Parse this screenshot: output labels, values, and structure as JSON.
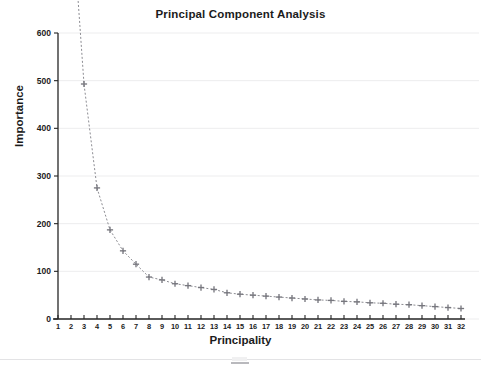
{
  "chart_data": {
    "type": "line",
    "title": "Principal Component Analysis",
    "xlabel": "Principality",
    "ylabel": "Importance",
    "xlim": [
      0.4,
      32.6
    ],
    "ylim": [
      0,
      600
    ],
    "grid": true,
    "legend_position": "none",
    "marker": "plus",
    "linestyle": "dotted",
    "series_color": "#8c8c92",
    "x": [
      1,
      2,
      3,
      4,
      5,
      6,
      7,
      8,
      9,
      10,
      11,
      12,
      13,
      14,
      15,
      16,
      17,
      18,
      19,
      20,
      21,
      22,
      23,
      24,
      25,
      26,
      27,
      28,
      29,
      30,
      31,
      32
    ],
    "values": [
      1480,
      880,
      493,
      275,
      187,
      143,
      115,
      88,
      82,
      74,
      70,
      66,
      62,
      55,
      52,
      50,
      48,
      46,
      44,
      42,
      40,
      39,
      37,
      36,
      34,
      33,
      31,
      30,
      28,
      26,
      24,
      22
    ],
    "x_tick_labels": [
      "1",
      "2",
      "3",
      "4",
      "5",
      "6",
      "7",
      "8",
      "9",
      "10",
      "11",
      "12",
      "13",
      "14",
      "15",
      "16",
      "17",
      "18",
      "19",
      "20",
      "21",
      "22",
      "23",
      "24",
      "25",
      "26",
      "27",
      "28",
      "29",
      "30",
      "31",
      "32"
    ],
    "y_tick_labels": [
      "0",
      "100",
      "200",
      "300",
      "400",
      "500",
      "600"
    ],
    "y_ticks": [
      0,
      100,
      200,
      300,
      400,
      500,
      600
    ],
    "note_offscale": "Points for principality 1 and 2 exceed the 600 axis maximum and are drawn off the top of the plot area"
  }
}
